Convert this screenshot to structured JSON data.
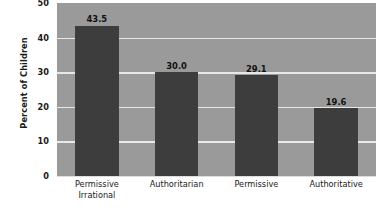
{
  "chart_data": {
    "type": "bar",
    "title": "",
    "subtitle": "",
    "xlabel": "",
    "ylabel": "Percent of Children",
    "categories": [
      "Permissive Irrational",
      "Authoritarian",
      "Permissive",
      "Authoritative"
    ],
    "category_lines": [
      [
        "Permissive",
        "Irrational"
      ],
      [
        "Authoritarian"
      ],
      [
        "Permissive"
      ],
      [
        "Authoritative"
      ]
    ],
    "values": [
      43.5,
      30.0,
      29.1,
      19.6
    ],
    "value_labels": [
      "43.5",
      "30.0",
      "29.1",
      "19.6"
    ],
    "ylim": [
      0,
      50
    ],
    "ytick_values": [
      0,
      10,
      20,
      30,
      40,
      50
    ],
    "ytick_labels": [
      "0",
      "10",
      "20",
      "30",
      "40",
      "50"
    ],
    "grid": true,
    "gridlines_at": [
      10,
      20,
      30,
      40
    ],
    "legend": false,
    "legend_position": "none",
    "colors": {
      "bar_fill": "#3d3d3d",
      "plot_background": "#9a9a9a",
      "figure_background": "#ffffff",
      "gridline": "#e8e8e8",
      "axis_line": "#dddddd",
      "text": "#1a1a1a"
    }
  }
}
